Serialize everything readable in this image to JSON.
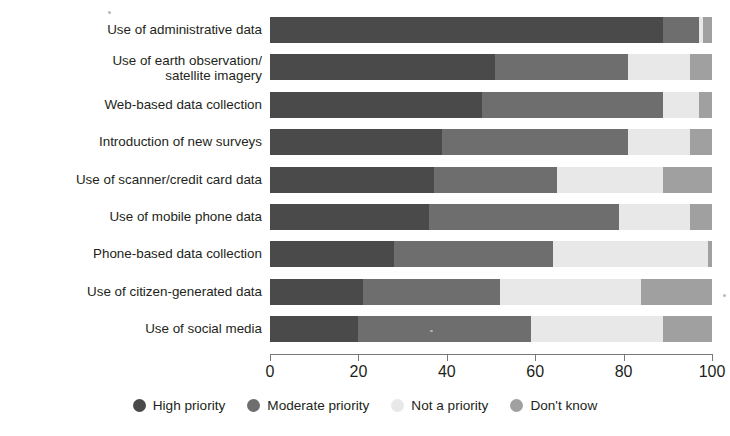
{
  "chart_data": {
    "type": "bar",
    "subtype": "stacked-horizontal-100",
    "title": "",
    "xlabel": "",
    "ylabel": "",
    "xlim": [
      0,
      100
    ],
    "xticks": [
      0,
      20,
      40,
      60,
      80,
      100
    ],
    "xtick_labels": [
      "0",
      "20",
      "40",
      "60",
      "80",
      "100"
    ],
    "grid": false,
    "legend_position": "bottom-center",
    "categories": [
      "Use of administrative data",
      "Use of earth observation/\nsatellite imagery",
      "Web-based data collection",
      "Introduction of new surveys",
      "Use of scanner/credit card data",
      "Use of mobile phone data",
      "Phone-based data collection",
      "Use of citizen-generated data",
      "Use of social media"
    ],
    "series": [
      {
        "name": "High priority",
        "color": "#4a4a4a",
        "values": [
          89,
          51,
          48,
          39,
          37,
          36,
          28,
          21,
          20
        ]
      },
      {
        "name": "Moderate priority",
        "color": "#6e6e6e",
        "values": [
          8,
          30,
          41,
          42,
          28,
          43,
          36,
          31,
          39
        ]
      },
      {
        "name": "Not a priority",
        "color": "#e8e8e8",
        "values": [
          1,
          14,
          8,
          14,
          24,
          16,
          35,
          32,
          30
        ]
      },
      {
        "name": "Don't know",
        "color": "#a0a0a0",
        "values": [
          2,
          5,
          3,
          5,
          11,
          5,
          1,
          16,
          11
        ]
      }
    ]
  },
  "legend": {
    "items": [
      {
        "label": "High priority",
        "color": "#4a4a4a"
      },
      {
        "label": "Moderate priority",
        "color": "#6e6e6e"
      },
      {
        "label": "Not a priority",
        "color": "#e8e8e8"
      },
      {
        "label": "Don't know",
        "color": "#a0a0a0"
      }
    ]
  }
}
